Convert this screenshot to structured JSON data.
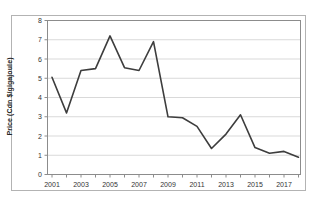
{
  "figure": {
    "background_color": "#ffffff",
    "border_color": "#b3b3b3"
  },
  "chart_data": {
    "type": "line",
    "title": "",
    "xlabel": "",
    "ylabel": "Price (Cdn $/gigajoule)",
    "x": [
      2001,
      2002,
      2003,
      2004,
      2005,
      2006,
      2007,
      2008,
      2009,
      2010,
      2011,
      2012,
      2013,
      2014,
      2015,
      2016,
      2017,
      2018
    ],
    "values": [
      5.05,
      3.2,
      5.4,
      5.5,
      7.2,
      5.55,
      5.4,
      6.9,
      3.0,
      2.95,
      2.5,
      1.35,
      2.1,
      3.1,
      1.4,
      1.1,
      1.2,
      0.9
    ],
    "ylim": [
      0,
      8
    ],
    "y_ticks": [
      0,
      1,
      2,
      3,
      4,
      5,
      6,
      7,
      8
    ],
    "x_tick_years_all": [
      2001,
      2002,
      2003,
      2004,
      2005,
      2006,
      2007,
      2008,
      2009,
      2010,
      2011,
      2012,
      2013,
      2014,
      2015,
      2016,
      2017,
      2018
    ],
    "x_tick_labels": [
      "2001",
      "2003",
      "2005",
      "2007",
      "2009",
      "2011",
      "2013",
      "2015",
      "2017"
    ],
    "grid": "horizontal",
    "legend": "none",
    "line_color": "#3d3d3d",
    "grid_color": "#d9d9d9",
    "axis_color": "#8c8c8c",
    "tick_label_color": "#333333"
  }
}
